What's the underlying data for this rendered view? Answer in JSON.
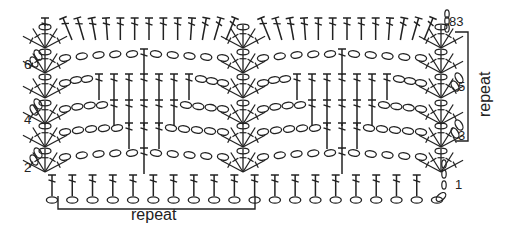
{
  "diagram": {
    "type": "crochet-stitch-chart",
    "stroke_color": "#222222",
    "background": "#ffffff",
    "row_labels": [
      {
        "row": 1,
        "text": "1",
        "side": "right"
      },
      {
        "row": 2,
        "text": "2",
        "side": "left"
      },
      {
        "row": 3,
        "text": "3",
        "side": "right"
      },
      {
        "row": 4,
        "text": "4",
        "side": "left"
      },
      {
        "row": 5,
        "text": "5",
        "side": "right"
      },
      {
        "row": 6,
        "text": "6",
        "side": "left"
      }
    ],
    "top_label": "83",
    "repeat_bottom_label": "repeat",
    "repeat_right_label": "repeat",
    "symbols": {
      "chain": "oval",
      "double_crochet": "tall stitch with crossbar",
      "shell": "fan cluster"
    },
    "rows": [
      {
        "row": 1,
        "pattern": "foundation chain with double crochet in each chain",
        "dc_count": 19
      },
      {
        "row": 2,
        "pattern": "shell, 5 ch, 1 dc, 5 ch, shell",
        "middle_dc": 1
      },
      {
        "row": 3,
        "pattern": "shell, 4 ch, 3 dc, 4 ch, shell",
        "middle_dc": 3
      },
      {
        "row": 4,
        "pattern": "shell, 3 ch, 5 dc, 3 ch, shell",
        "middle_dc": 5
      },
      {
        "row": 5,
        "pattern": "shell, 2 ch, 7 dc, 2 ch, shell",
        "middle_dc": 7
      },
      {
        "row": 6,
        "pattern": "shell, 5 ch, 1 dc, 5 ch, shell",
        "middle_dc": 1
      },
      {
        "row": 7,
        "pattern": "dc across top",
        "dc_count": 19
      }
    ]
  }
}
